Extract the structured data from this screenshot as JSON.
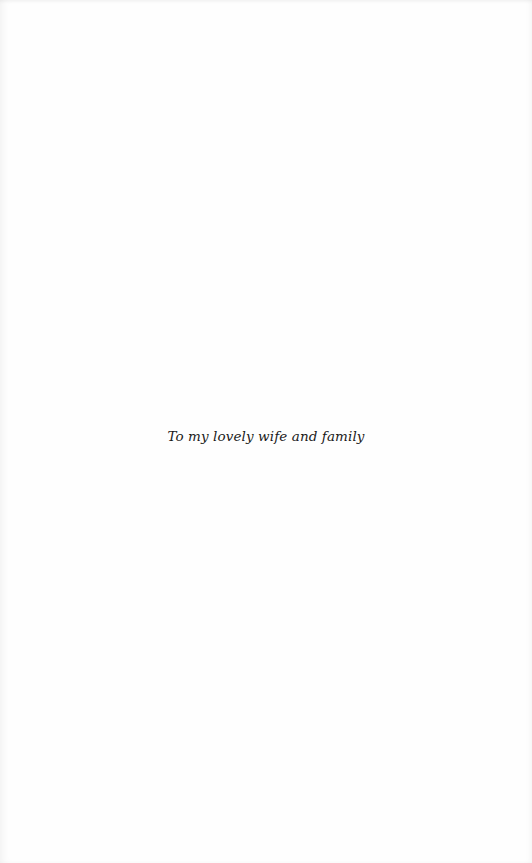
{
  "page": {
    "type": "dedication",
    "dedication_text": "To my lovely wife and family"
  }
}
